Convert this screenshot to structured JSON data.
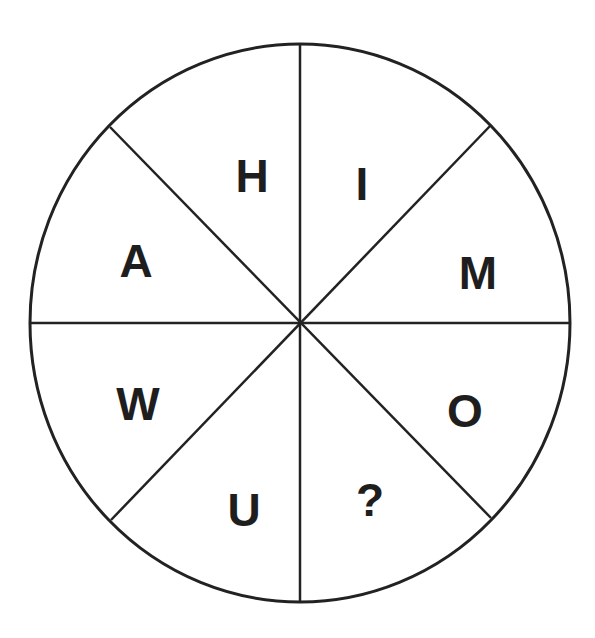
{
  "puzzle": {
    "segments": [
      {
        "position": "top-left-upper",
        "label": "H"
      },
      {
        "position": "top-right-upper",
        "label": "I"
      },
      {
        "position": "right-upper",
        "label": "M"
      },
      {
        "position": "right-lower",
        "label": "O"
      },
      {
        "position": "bottom-right",
        "label": "?"
      },
      {
        "position": "bottom-left",
        "label": "U"
      },
      {
        "position": "left-lower",
        "label": "W"
      },
      {
        "position": "left-upper",
        "label": "A"
      }
    ],
    "line_color": "#222222",
    "text_color": "#1e1e1e"
  }
}
